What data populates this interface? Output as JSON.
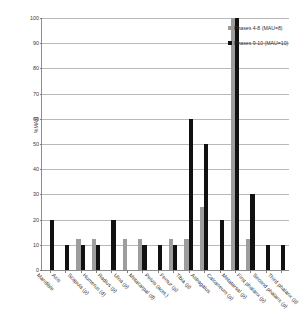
{
  "chart_data": {
    "type": "bar",
    "title": "",
    "subtitle": "",
    "xlabel": "",
    "ylabel": "%MAU",
    "ylim": [
      0,
      100
    ],
    "yticks": [
      0,
      10,
      20,
      30,
      40,
      50,
      60,
      70,
      80,
      90,
      100
    ],
    "grid": true,
    "legend_position": "top-right",
    "categories": [
      "Mandible",
      "Axis",
      "Scapula (p)",
      "Humerus (d)",
      "Radius (p)",
      "Ulna (p)",
      "Metacarpal (d)",
      "Pelvis (acet.)",
      "Femur (p)",
      "Tibia (p)",
      "Astragalus",
      "Calcaneum (p)",
      "Metatarsal (p)",
      "First phalanx (p)",
      "Second phalanx (p)",
      "Third phalanx (p)"
    ],
    "series": [
      {
        "name": "Phases 4-8 (MAU=8)",
        "color": "#9d9d9d",
        "values": [
          0,
          0,
          12.5,
          12.5,
          0,
          12.5,
          12.5,
          0,
          12.5,
          12.5,
          25,
          0,
          100,
          12.5,
          0,
          0
        ]
      },
      {
        "name": "Phases 9-10 (MAU=10)",
        "color": "#111111",
        "values": [
          20,
          10,
          10,
          10,
          20,
          0,
          10,
          10,
          10,
          60,
          50,
          20,
          100,
          30,
          10,
          10
        ]
      }
    ]
  },
  "legend": {
    "items": [
      {
        "label": "Phases 4-8 (MAU=8)"
      },
      {
        "label": "Phases 9-10 (MAU=10)"
      }
    ]
  },
  "axis": {
    "y_title": "%MAU"
  }
}
